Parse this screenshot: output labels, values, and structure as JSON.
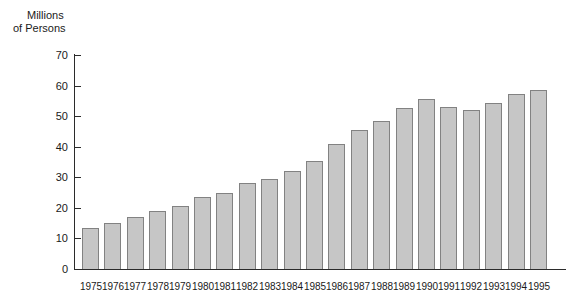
{
  "chart_data": {
    "type": "bar",
    "title": "",
    "subtitle": "",
    "xlabel": "",
    "ylabel": "Millions of Persons",
    "ylabel_lines": [
      "Millions",
      "of Persons"
    ],
    "ylim": [
      0,
      70
    ],
    "y_ticks": [
      0,
      10,
      20,
      30,
      40,
      50,
      60,
      70
    ],
    "y_tick_labels": [
      "0",
      "10",
      "20",
      "30",
      "40",
      "50",
      "60",
      "70"
    ],
    "grid": false,
    "legend": null,
    "categories": [
      "1975",
      "1976",
      "1977",
      "1978",
      "1979",
      "1980",
      "1981",
      "1982",
      "1983",
      "1984",
      "1985",
      "1986",
      "1987",
      "1988",
      "1989",
      "1990",
      "1991",
      "1992",
      "1993",
      "1994",
      "1995"
    ],
    "values": [
      13.4,
      15.0,
      17.0,
      19.0,
      20.5,
      23.4,
      24.8,
      28.0,
      29.3,
      32.0,
      35.4,
      41.0,
      45.6,
      48.3,
      52.8,
      55.5,
      52.9,
      52.1,
      54.4,
      57.3,
      58.4
    ],
    "series": [
      {
        "name": "Persons",
        "values": [
          13.4,
          15.0,
          17.0,
          19.0,
          20.5,
          23.4,
          24.8,
          28.0,
          29.3,
          32.0,
          35.4,
          41.0,
          45.6,
          48.3,
          52.8,
          55.5,
          52.9,
          52.1,
          54.4,
          57.3,
          58.4
        ]
      }
    ],
    "colors": {
      "bar_fill": "#c6c6c6",
      "bar_border": "#828282",
      "axis": "#2b2b2b",
      "text": "#1a1a1a",
      "background": "#ffffff"
    }
  }
}
